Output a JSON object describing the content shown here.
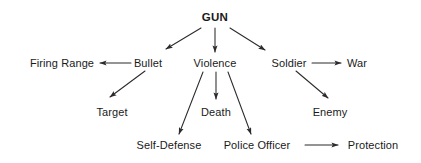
{
  "diagram": {
    "type": "concept-map",
    "title": "GUN",
    "background_color": "#ffffff",
    "stroke_color": "#2b2b2b",
    "text_color": "#1a1a1a",
    "nodes": [
      {
        "id": "gun",
        "label": "GUN",
        "x": 215,
        "y": 17,
        "level": 0,
        "emphasis": "bold"
      },
      {
        "id": "firing-range",
        "label": "Firing Range",
        "x": 62,
        "y": 63,
        "level": 1,
        "emphasis": "normal"
      },
      {
        "id": "bullet",
        "label": "Bullet",
        "x": 148,
        "y": 63,
        "level": 1,
        "emphasis": "normal"
      },
      {
        "id": "violence",
        "label": "Violence",
        "x": 215,
        "y": 63,
        "level": 1,
        "emphasis": "normal"
      },
      {
        "id": "soldier",
        "label": "Soldier",
        "x": 289,
        "y": 63,
        "level": 1,
        "emphasis": "normal"
      },
      {
        "id": "war",
        "label": "War",
        "x": 357,
        "y": 63,
        "level": 1,
        "emphasis": "normal"
      },
      {
        "id": "target",
        "label": "Target",
        "x": 112,
        "y": 112,
        "level": 2,
        "emphasis": "normal"
      },
      {
        "id": "death",
        "label": "Death",
        "x": 216,
        "y": 112,
        "level": 2,
        "emphasis": "normal"
      },
      {
        "id": "enemy",
        "label": "Enemy",
        "x": 330,
        "y": 112,
        "level": 2,
        "emphasis": "normal"
      },
      {
        "id": "self-defense",
        "label": "Self-Defense",
        "x": 169,
        "y": 145,
        "level": 3,
        "emphasis": "normal"
      },
      {
        "id": "police-officer",
        "label": "Police Officer",
        "x": 257,
        "y": 145,
        "level": 3,
        "emphasis": "normal"
      },
      {
        "id": "protection",
        "label": "Protection",
        "x": 373,
        "y": 145,
        "level": 3,
        "emphasis": "normal"
      }
    ],
    "edges": [
      {
        "id": "gun-bullet",
        "from": "gun",
        "to": "bullet",
        "x1": 201,
        "y1": 28,
        "x2": 166,
        "y2": 49,
        "direction": "down-left"
      },
      {
        "id": "gun-violence",
        "from": "gun",
        "to": "violence",
        "x1": 215,
        "y1": 28,
        "x2": 215,
        "y2": 52,
        "direction": "down"
      },
      {
        "id": "gun-soldier",
        "from": "gun",
        "to": "soldier",
        "x1": 230,
        "y1": 28,
        "x2": 265,
        "y2": 50,
        "direction": "down-right"
      },
      {
        "id": "bullet-firing-range",
        "from": "bullet",
        "to": "firing-range",
        "x1": 131,
        "y1": 63,
        "x2": 100,
        "y2": 63,
        "direction": "left"
      },
      {
        "id": "bullet-target",
        "from": "bullet",
        "to": "target",
        "x1": 145,
        "y1": 71,
        "x2": 110,
        "y2": 97,
        "direction": "down-left"
      },
      {
        "id": "violence-self-defense",
        "from": "violence",
        "to": "self-defense",
        "x1": 203,
        "y1": 72,
        "x2": 179,
        "y2": 134,
        "direction": "down-left"
      },
      {
        "id": "violence-death",
        "from": "violence",
        "to": "death",
        "x1": 216,
        "y1": 72,
        "x2": 216,
        "y2": 99,
        "direction": "down"
      },
      {
        "id": "violence-police-officer",
        "from": "violence",
        "to": "police-officer",
        "x1": 228,
        "y1": 72,
        "x2": 251,
        "y2": 134,
        "direction": "down-right"
      },
      {
        "id": "soldier-war",
        "from": "soldier",
        "to": "war",
        "x1": 312,
        "y1": 63,
        "x2": 341,
        "y2": 63,
        "direction": "right"
      },
      {
        "id": "soldier-enemy",
        "from": "soldier",
        "to": "enemy",
        "x1": 296,
        "y1": 71,
        "x2": 328,
        "y2": 98,
        "direction": "down-right"
      },
      {
        "id": "police-officer-protection",
        "from": "police-officer",
        "to": "protection",
        "x1": 305,
        "y1": 145,
        "x2": 338,
        "y2": 145,
        "direction": "right"
      }
    ]
  }
}
